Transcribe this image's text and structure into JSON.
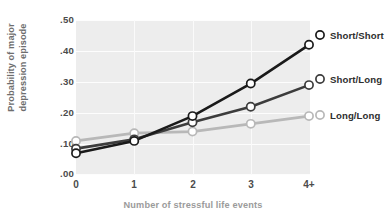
{
  "chart_data": {
    "type": "line",
    "title": "",
    "xlabel": "Number of stressful life events",
    "ylabel_line1": "Probability of major",
    "ylabel_line2": "depression episode",
    "categories": [
      "0",
      "1",
      "2",
      "3",
      "4+"
    ],
    "xticks": [
      "0",
      "1",
      "2",
      "3",
      "4+"
    ],
    "yticks": [
      ".00",
      ".10",
      ".20",
      ".30",
      ".40",
      ".50"
    ],
    "ylim": [
      0.0,
      0.5
    ],
    "ytick_values": [
      0.0,
      0.1,
      0.2,
      0.3,
      0.4,
      0.5
    ],
    "grid": true,
    "legend_position": "right",
    "plot_background": "#ededed",
    "series": [
      {
        "name": "Short/Short",
        "color": "#1a1a1a",
        "marker": "open-circle",
        "values": [
          0.07,
          0.11,
          0.19,
          0.295,
          0.42
        ]
      },
      {
        "name": "Short/Long",
        "color": "#3c3c3c",
        "marker": "open-circle",
        "values": [
          0.085,
          0.115,
          0.17,
          0.22,
          0.29
        ]
      },
      {
        "name": "Long/Long",
        "color": "#b8b8b8",
        "marker": "open-circle",
        "values": [
          0.11,
          0.135,
          0.14,
          0.165,
          0.19
        ]
      }
    ]
  },
  "axes": {
    "ytick_0": ".50",
    "ytick_1": ".40",
    "ytick_2": ".30",
    "ytick_3": ".20",
    "ytick_4": ".10",
    "ytick_5": ".00",
    "xtick_0": "0",
    "xtick_1": "1",
    "xtick_2": "2",
    "xtick_3": "3",
    "xtick_4": "4+",
    "xlabel": "Number of stressful life events",
    "ylabel_line1": "Probability of major",
    "ylabel_line2": "depression episode"
  },
  "legend": {
    "item_0": "Short/Short",
    "item_1": "Short/Long",
    "item_2": "Long/Long"
  }
}
